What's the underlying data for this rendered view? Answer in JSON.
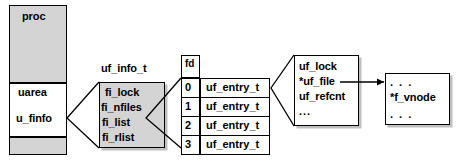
{
  "diagram": {
    "colors": {
      "fill_gray": "#d4d4d4",
      "fill_white": "#ffffff",
      "stroke": "#000000"
    },
    "proc_struct": {
      "name": "proc-structure",
      "top_label": "proc",
      "uarea_label": "uarea",
      "ufinfo_label": "u_finfo"
    },
    "uf_info_t": {
      "title": "uf_info_t",
      "fields": [
        "fi_lock",
        "fi_nfiles",
        "fi_list",
        "fi_rlist"
      ]
    },
    "fd_table": {
      "header": "fd",
      "rows": [
        {
          "index": "0",
          "value": "uf_entry_t"
        },
        {
          "index": "1",
          "value": "uf_entry_t"
        },
        {
          "index": "2",
          "value": "uf_entry_t"
        },
        {
          "index": "3",
          "value": "uf_entry_t"
        }
      ]
    },
    "uf_entry_detail": {
      "fields": [
        "uf_lock",
        "*uf_file",
        "uf_refcnt",
        "..."
      ]
    },
    "file_struct": {
      "fields": [
        ". . .",
        "*f_vnode",
        ". . ."
      ]
    }
  }
}
